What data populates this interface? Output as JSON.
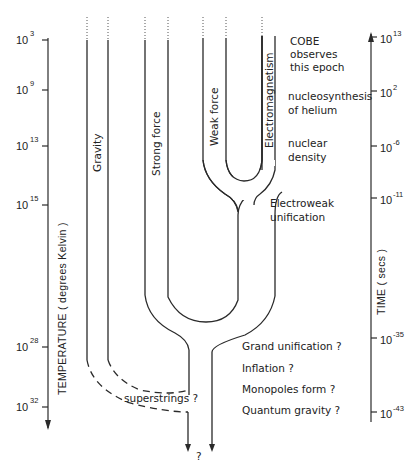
{
  "diagram": {
    "left_axis": {
      "title": "TEMPERATURE ( degrees Kelvin )",
      "direction": "down",
      "ticks": [
        {
          "base": "10",
          "exp": "3"
        },
        {
          "base": "10",
          "exp": "9"
        },
        {
          "base": "10",
          "exp": "13"
        },
        {
          "base": "10",
          "exp": "15"
        },
        {
          "base": "10",
          "exp": "28"
        },
        {
          "base": "10",
          "exp": "32"
        }
      ]
    },
    "right_axis": {
      "title": "TIME ( secs )",
      "direction": "up",
      "ticks": [
        {
          "base": "10",
          "exp": "13"
        },
        {
          "base": "10",
          "exp": "2"
        },
        {
          "base": "10",
          "exp": "-6"
        },
        {
          "base": "10",
          "exp": "-11"
        },
        {
          "base": "10",
          "exp": "-35"
        },
        {
          "base": "10",
          "exp": "-43"
        }
      ]
    },
    "forces": {
      "gravity": "Gravity",
      "strong": "Strong force",
      "weak": "Weak force",
      "em": "Electromagnetism"
    },
    "annotations": {
      "cobe": [
        "COBE",
        "observes",
        "this epoch"
      ],
      "nucleosynthesis": [
        "nucleosynthesis",
        "of helium"
      ],
      "nuclear": [
        "nuclear",
        "density"
      ],
      "electroweak": [
        "Electroweak",
        "unification"
      ],
      "grand": "Grand unification ?",
      "inflation": "Inflation ?",
      "monopoles": "Monopoles form ?",
      "quantum": "Quantum gravity ?",
      "superstrings": "superstrings ?",
      "unknown": "?"
    }
  }
}
